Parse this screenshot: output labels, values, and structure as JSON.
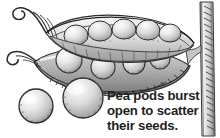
{
  "figure": {
    "background_color": "#ffffff",
    "ink_color": "#231f20"
  },
  "caption": {
    "lines": [
      "Pea pods burst",
      "open to scatter",
      "their seeds."
    ],
    "full_text": "Pea pods burst open to scatter their seeds.",
    "color": "#231f20"
  },
  "illustration": {
    "style": "pen-and-ink engraving with gray wash",
    "palette": {
      "outline": "#2b2b2b",
      "pod_light": "#f2f2f2",
      "pod_mid": "#b9b9b9",
      "pod_shadow": "#6e6e6e",
      "pea_light": "#fbfbfb",
      "pea_mid": "#cfcfcf",
      "pea_shadow": "#8a8a8a",
      "stem_light": "#ededed",
      "stem_mid": "#a9a9a9"
    },
    "parts": [
      {
        "name": "upper-pod-valve",
        "label": "Upper pod valve, split open"
      },
      {
        "name": "lower-pod-valve",
        "label": "Lower pod valve holding peas"
      },
      {
        "name": "tendril-upper",
        "label": "Curled tendril, upper left"
      },
      {
        "name": "tendril-lower",
        "label": "Curled tendril, lower left"
      },
      {
        "name": "peas-in-upper-valve",
        "label": "Row of peas in upper valve",
        "count": 6
      },
      {
        "name": "peas-in-lower-valve",
        "label": "Peas resting in lower valve",
        "count": 4
      },
      {
        "name": "loose-pea-left",
        "label": "Scattered pea, far left"
      },
      {
        "name": "loose-pea-center",
        "label": "Scattered pea, below pod"
      },
      {
        "name": "plant-stem",
        "label": "Vertical plant stem at right"
      }
    ]
  }
}
